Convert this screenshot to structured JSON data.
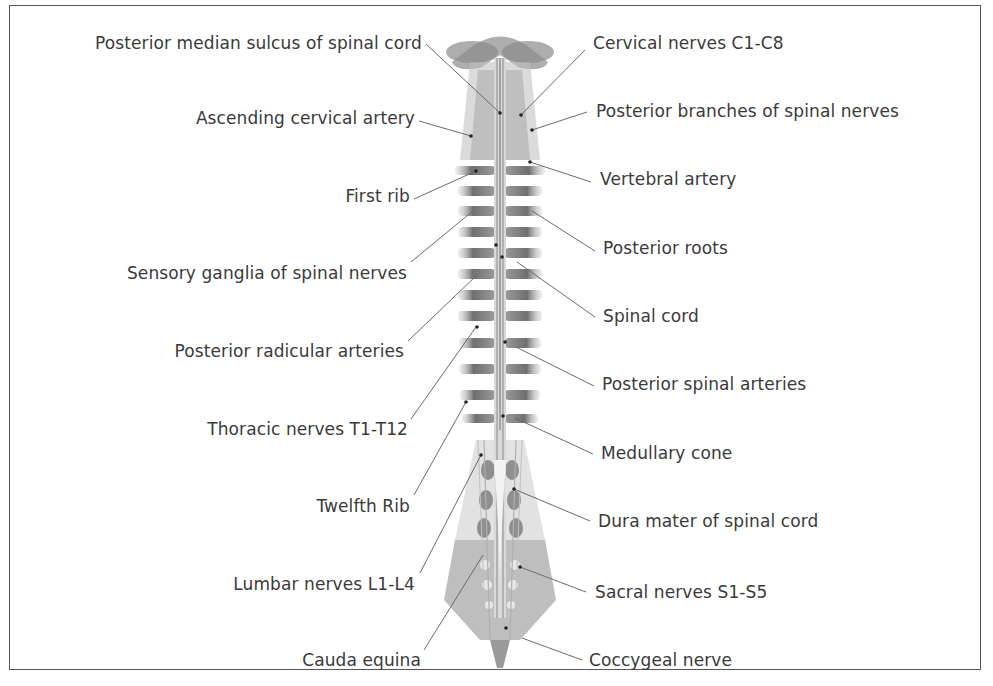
{
  "diagram": {
    "colors": {
      "frame": "#555555",
      "text": "#3a3a3a",
      "leader_line": "#6a6a6a",
      "bone": "#8c8c8c",
      "nerve": "#bdbdbd"
    },
    "labels_left": [
      {
        "text": "Posterior median sulcus of spinal cord",
        "x_right": 422,
        "y": 43
      },
      {
        "text": "Ascending cervical artery",
        "x_right": 415,
        "y": 118
      },
      {
        "text": "First rib",
        "x_right": 410,
        "y": 196
      },
      {
        "text": "Sensory ganglia of spinal nerves",
        "x_right": 407,
        "y": 273
      },
      {
        "text": "Posterior radicular arteries",
        "x_right": 404,
        "y": 351
      },
      {
        "text": "Thoracic nerves T1-T12",
        "x_right": 408,
        "y": 429
      },
      {
        "text": "Twelfth Rib",
        "x_right": 410,
        "y": 506
      },
      {
        "text": "Lumbar nerves L1-L4",
        "x_right": 415,
        "y": 584
      },
      {
        "text": "Cauda equina",
        "x_right": 421,
        "y": 660
      }
    ],
    "labels_right": [
      {
        "text": "Cervical nerves C1-C8",
        "x_left": 593,
        "y": 43
      },
      {
        "text": "Posterior branches of spinal nerves",
        "x_left": 596,
        "y": 111
      },
      {
        "text": "Vertebral artery",
        "x_left": 600,
        "y": 179
      },
      {
        "text": "Posterior roots",
        "x_left": 603,
        "y": 248
      },
      {
        "text": "Spinal cord",
        "x_left": 603,
        "y": 316
      },
      {
        "text": "Posterior spinal arteries",
        "x_left": 602,
        "y": 384
      },
      {
        "text": "Medullary cone",
        "x_left": 601,
        "y": 453
      },
      {
        "text": "Dura mater of spinal cord",
        "x_left": 598,
        "y": 521
      },
      {
        "text": "Sacral nerves S1-S5",
        "x_left": 595,
        "y": 592
      },
      {
        "text": "Coccygeal nerve",
        "x_left": 589,
        "y": 660
      }
    ]
  }
}
